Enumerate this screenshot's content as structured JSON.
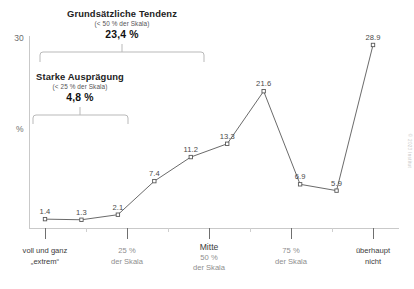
{
  "chart_data": {
    "type": "line",
    "title": "",
    "xlabel": "",
    "ylabel": "%",
    "ylim": [
      0,
      30
    ],
    "yticks": [
      0,
      30
    ],
    "ytick_labels": [
      "",
      "30"
    ],
    "grid": false,
    "legend": null,
    "categories": [
      "1",
      "2",
      "3",
      "4",
      "5",
      "6",
      "7",
      "8",
      "9",
      "10"
    ],
    "values": [
      1.4,
      1.3,
      2.1,
      7.4,
      11.2,
      13.3,
      21.6,
      6.9,
      5.9,
      28.9
    ],
    "point_labels": [
      "1.4",
      "1.3",
      "2.1",
      "7.4",
      "11.2",
      "13.3",
      "21.6",
      "6.9",
      "5.9",
      "28.9"
    ],
    "marker": "open-square",
    "line_color": "#595959",
    "marker_color": "#595959"
  },
  "axis": {
    "y_top_label": "30",
    "y_title": "%",
    "x_ticks": [
      {
        "lines": [
          "voll und ganz",
          "„extrem“"
        ],
        "emphasis": "dark"
      },
      {
        "lines": [
          "25 %",
          "der Skala"
        ],
        "emphasis": "light"
      },
      {
        "lines": [
          "Mitte",
          "50 %",
          "der Skala"
        ],
        "emphasis": "mitte"
      },
      {
        "lines": [
          "75 %",
          "der Skala"
        ],
        "emphasis": "light"
      },
      {
        "lines": [
          "überhaupt",
          "nicht"
        ],
        "emphasis": "dark"
      }
    ]
  },
  "annotations": {
    "outer": {
      "title": "Grundsätzliche Tendenz",
      "subtitle": "(< 50 % der Skala)",
      "value": "23,4 %"
    },
    "inner": {
      "title": "Starke Ausprägung",
      "subtitle": "(< 25 % der Skala)",
      "value": "4,8 %"
    }
  },
  "watermark": {
    "text": "© 2023 Institut"
  },
  "colors": {
    "line": "#595959",
    "axis": "#c9c9c9",
    "tick": "#6f6f6f",
    "text_dark": "#3b3b3b",
    "text_light": "#8e8e8e"
  }
}
